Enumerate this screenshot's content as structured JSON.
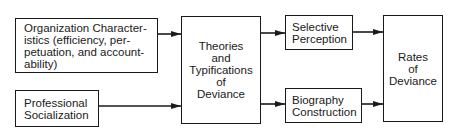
{
  "diagram": {
    "type": "flowchart",
    "nodes": [
      {
        "id": "org",
        "label": "Organization Character-\nistics (efficiency, per-\npetuation, and account-\nability)"
      },
      {
        "id": "prof",
        "label": "Professional\nSocialization"
      },
      {
        "id": "theories",
        "label": "Theories\nand\nTypifications\nof\nDeviance"
      },
      {
        "id": "selective",
        "label": "Selective\nPerception"
      },
      {
        "id": "biography",
        "label": "Biography\nConstruction"
      },
      {
        "id": "rates",
        "label": "Rates\nof\nDeviance"
      }
    ],
    "edges": [
      {
        "from": "org",
        "to": "theories"
      },
      {
        "from": "prof",
        "to": "theories"
      },
      {
        "from": "theories",
        "to": "selective"
      },
      {
        "from": "theories",
        "to": "biography"
      },
      {
        "from": "selective",
        "to": "rates"
      },
      {
        "from": "biography",
        "to": "rates"
      }
    ],
    "colors": {
      "stroke": "#1a1a1a",
      "background": "#ffffff"
    }
  }
}
